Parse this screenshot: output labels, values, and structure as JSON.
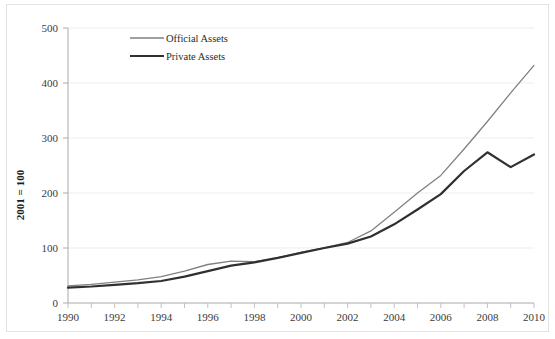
{
  "chart_data": {
    "type": "line",
    "title": "",
    "subtitle": "",
    "xlabel": "",
    "ylabel": "2001 = 100",
    "xlim": [
      1990,
      2010
    ],
    "ylim": [
      0,
      500
    ],
    "ytick_labels": [
      "0",
      "100",
      "200",
      "300",
      "400",
      "500"
    ],
    "yticks": [
      0,
      100,
      200,
      300,
      400,
      500
    ],
    "xtick_labels": [
      "1990",
      "1992",
      "1994",
      "1996",
      "1998",
      "2000",
      "2002",
      "2004",
      "2006",
      "2008",
      "2010"
    ],
    "xticks": [
      1990,
      1992,
      1994,
      1996,
      1998,
      2000,
      2002,
      2004,
      2006,
      2008,
      2010
    ],
    "x": [
      1990,
      1991,
      1992,
      1993,
      1994,
      1995,
      1996,
      1997,
      1998,
      1999,
      2000,
      2001,
      2002,
      2003,
      2004,
      2005,
      2006,
      2007,
      2008,
      2009,
      2010
    ],
    "grid": "horizontal",
    "legend_position": "upper-left-inside",
    "series": [
      {
        "name": "Official Assets",
        "color": "#808080",
        "line_width": 1.3,
        "values": [
          31,
          34,
          38,
          42,
          48,
          58,
          70,
          76,
          75,
          82,
          92,
          100,
          110,
          131,
          165,
          200,
          232,
          280,
          330,
          382,
          432
        ]
      },
      {
        "name": "Private Assets",
        "color": "#303030",
        "line_width": 2.2,
        "values": [
          28,
          30,
          33,
          36,
          40,
          48,
          58,
          68,
          74,
          82,
          91,
          100,
          108,
          121,
          143,
          170,
          198,
          240,
          274,
          247,
          270
        ]
      }
    ]
  },
  "legend": {
    "items": [
      {
        "label": "Official Assets"
      },
      {
        "label": "Private Assets"
      }
    ]
  },
  "axis": {
    "y_title": "2001 = 100"
  }
}
